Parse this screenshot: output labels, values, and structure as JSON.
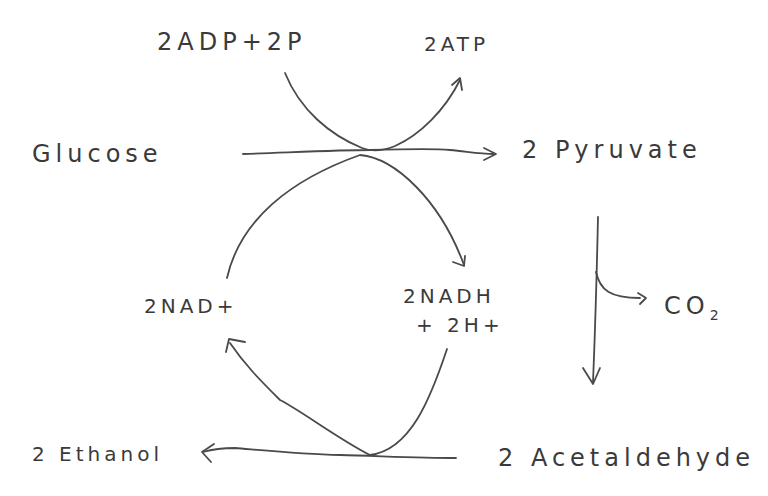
{
  "diagram": {
    "type": "metabolic-pathway",
    "title": "",
    "labels": {
      "adp_input": "2ADP+2P",
      "atp_output": "2ATP",
      "glucose": "Glucose",
      "pyruvate": "2 Pyruvate",
      "nad_plus": "2NAD+",
      "nadh_line1": "2NADH",
      "nadh_line2": "+ 2H+",
      "co2_main": "CO",
      "co2_sub": "2",
      "ethanol": "2 Ethanol",
      "acetaldehyde": "2 Acetaldehyde"
    },
    "nodes": [
      {
        "id": "glucose",
        "label": "Glucose"
      },
      {
        "id": "pyruvate",
        "label": "2 Pyruvate"
      },
      {
        "id": "acetaldehyde",
        "label": "2 Acetaldehyde"
      },
      {
        "id": "ethanol",
        "label": "2 Ethanol"
      },
      {
        "id": "adp",
        "label": "2 ADP + 2 P"
      },
      {
        "id": "atp",
        "label": "2 ATP"
      },
      {
        "id": "nad",
        "label": "2 NAD+"
      },
      {
        "id": "nadh",
        "label": "2 NADH + 2 H+"
      },
      {
        "id": "co2",
        "label": "CO2"
      }
    ],
    "edges": [
      {
        "from": "glucose",
        "to": "pyruvate"
      },
      {
        "from": "adp",
        "to": "atp"
      },
      {
        "from": "nad",
        "to": "nadh"
      },
      {
        "from": "pyruvate",
        "to": "acetaldehyde"
      },
      {
        "from": "pyruvate",
        "to": "co2"
      },
      {
        "from": "acetaldehyde",
        "to": "ethanol"
      },
      {
        "from": "nadh",
        "to": "nad"
      }
    ],
    "stroke_color": "#4a4a4a",
    "text_color": "#3a3a3a",
    "background": "#ffffff"
  }
}
